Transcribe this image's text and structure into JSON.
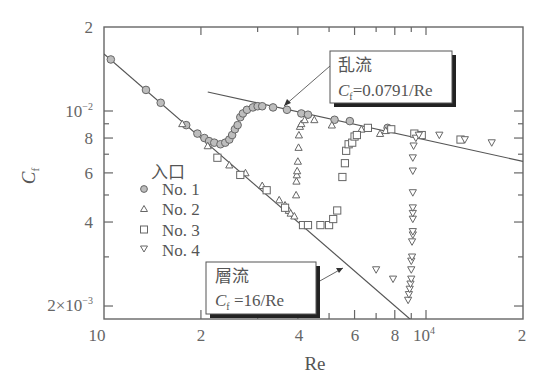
{
  "chart_data": {
    "type": "scatter",
    "title": "",
    "xlabel": "Re",
    "ylabel": "C_f",
    "xscale": "log",
    "yscale": "log",
    "xlim": [
      1000,
      20000
    ],
    "ylim": [
      0.0018,
      0.02
    ],
    "x_tick_labels": [
      {
        "value": 1000,
        "label": "10"
      },
      {
        "value": 2000,
        "label": "2"
      },
      {
        "value": 4000,
        "label": "4"
      },
      {
        "value": 6000,
        "label": "6"
      },
      {
        "value": 8000,
        "label": "8"
      },
      {
        "value": 10000,
        "label": "10",
        "sup": "4"
      },
      {
        "value": 20000,
        "label": "2"
      }
    ],
    "x_minor_ticks": [
      3000,
      5000,
      7000,
      9000
    ],
    "y_tick_labels": [
      {
        "value": 0.02,
        "label": "2"
      },
      {
        "value": 0.01,
        "label": "10",
        "sup": "−2"
      },
      {
        "value": 0.008,
        "label": "8"
      },
      {
        "value": 0.006,
        "label": "6"
      },
      {
        "value": 0.004,
        "label": "4"
      },
      {
        "value": 0.002,
        "label": "2×10",
        "sup": "−3"
      }
    ],
    "y_minor_ticks": [
      0.009,
      0.007,
      0.005,
      0.003
    ],
    "legend": {
      "title": "入口",
      "position": "left-middle",
      "entries": [
        {
          "label": "No. 1",
          "marker": "circle-filled"
        },
        {
          "label": "No. 2",
          "marker": "triangle-up"
        },
        {
          "label": "No. 3",
          "marker": "square"
        },
        {
          "label": "No. 4",
          "marker": "triangle-down"
        }
      ]
    },
    "lines": [
      {
        "name": "層流",
        "equation": "C_f = 16/Re",
        "x": [
          1000,
          9000
        ],
        "y": [
          0.016,
          0.00178
        ]
      },
      {
        "name": "乱流",
        "equation": "C_f = 0.0791/Re^0.25",
        "x": [
          2100,
          20000
        ],
        "y": [
          0.0117,
          0.0066
        ]
      }
    ],
    "annotations": [
      {
        "line1": "乱流",
        "line2_prefix": "C",
        "line2_sub": "f",
        "line2_rest": "=0.0791/Re"
      },
      {
        "line1": "層流",
        "line2_prefix": "C",
        "line2_sub": "f",
        "line2_rest": " =16/Re"
      }
    ],
    "series": [
      {
        "name": "No. 1",
        "marker": "circle-filled",
        "points": [
          [
            1050,
            0.0153
          ],
          [
            1350,
            0.0119
          ],
          [
            1500,
            0.0107
          ],
          [
            1800,
            0.0089
          ],
          [
            1950,
            0.0083
          ],
          [
            2050,
            0.008
          ],
          [
            2120,
            0.0078
          ],
          [
            2200,
            0.0077
          ],
          [
            2300,
            0.0076
          ],
          [
            2380,
            0.0077
          ],
          [
            2450,
            0.0079
          ],
          [
            2500,
            0.0082
          ],
          [
            2550,
            0.0086
          ],
          [
            2600,
            0.0089
          ],
          [
            2650,
            0.0095
          ],
          [
            2700,
            0.0098
          ],
          [
            2780,
            0.0101
          ],
          [
            2900,
            0.0103
          ],
          [
            3000,
            0.0104
          ],
          [
            3100,
            0.0104
          ],
          [
            3350,
            0.0103
          ],
          [
            3700,
            0.0101
          ],
          [
            4100,
            0.0098
          ],
          [
            4300,
            0.0097
          ],
          [
            5200,
            0.0093
          ],
          [
            5800,
            0.0092
          ],
          [
            7600,
            0.0087
          ]
        ]
      },
      {
        "name": "No. 2",
        "marker": "triangle-up",
        "points": [
          [
            1750,
            0.009
          ],
          [
            2100,
            0.0075
          ],
          [
            2450,
            0.0064
          ],
          [
            2750,
            0.006
          ],
          [
            3100,
            0.0054
          ],
          [
            3500,
            0.0048
          ],
          [
            3650,
            0.0046
          ],
          [
            3750,
            0.0044
          ],
          [
            3800,
            0.0043
          ],
          [
            3900,
            0.0042
          ],
          [
            3950,
            0.005
          ],
          [
            3960,
            0.0056
          ],
          [
            3970,
            0.0059
          ],
          [
            3980,
            0.0061
          ],
          [
            4000,
            0.0066
          ],
          [
            4020,
            0.0074
          ],
          [
            4030,
            0.0082
          ],
          [
            4060,
            0.0088
          ],
          [
            4100,
            0.009
          ],
          [
            4200,
            0.0093
          ],
          [
            4500,
            0.0093
          ],
          [
            5100,
            0.0089
          ],
          [
            6300,
            0.0086
          ],
          [
            7200,
            0.0083
          ],
          [
            7500,
            0.0085
          ]
        ]
      },
      {
        "name": "No. 3",
        "marker": "square",
        "points": [
          [
            2250,
            0.0068
          ],
          [
            2650,
            0.0059
          ],
          [
            3200,
            0.0052
          ],
          [
            3650,
            0.0045
          ],
          [
            4150,
            0.0039
          ],
          [
            4300,
            0.0039
          ],
          [
            4700,
            0.0039
          ],
          [
            5000,
            0.0039
          ],
          [
            5150,
            0.0041
          ],
          [
            5300,
            0.0044
          ],
          [
            5500,
            0.0058
          ],
          [
            5600,
            0.0065
          ],
          [
            5650,
            0.0072
          ],
          [
            5750,
            0.0076
          ],
          [
            5900,
            0.0077
          ],
          [
            6000,
            0.0081
          ],
          [
            6100,
            0.0082
          ],
          [
            6600,
            0.0087
          ],
          [
            7800,
            0.0086
          ],
          [
            9200,
            0.0083
          ],
          [
            9700,
            0.0082
          ],
          [
            12800,
            0.0079
          ]
        ]
      },
      {
        "name": "No. 4",
        "marker": "triangle-down",
        "points": [
          [
            7000,
            0.0027
          ],
          [
            7900,
            0.0025
          ],
          [
            8800,
            0.0021
          ],
          [
            8850,
            0.0022
          ],
          [
            8900,
            0.0023
          ],
          [
            8950,
            0.0024
          ],
          [
            9000,
            0.0025
          ],
          [
            9000,
            0.0027
          ],
          [
            9000,
            0.0029
          ],
          [
            9050,
            0.003
          ],
          [
            9050,
            0.0034
          ],
          [
            9100,
            0.0036
          ],
          [
            9100,
            0.0037
          ],
          [
            9100,
            0.0041
          ],
          [
            9100,
            0.0043
          ],
          [
            9100,
            0.0045
          ],
          [
            9100,
            0.0051
          ],
          [
            9100,
            0.0061
          ],
          [
            9100,
            0.0068
          ],
          [
            9150,
            0.0075
          ],
          [
            9300,
            0.008
          ],
          [
            9500,
            0.0082
          ],
          [
            11000,
            0.0082
          ],
          [
            13200,
            0.0079
          ],
          [
            16000,
            0.0077
          ]
        ]
      }
    ]
  },
  "labels": {
    "xlabel": "Re",
    "ylabel_main": "C",
    "ylabel_sub": "f",
    "legend_title": "入口",
    "legend_1": "No. 1",
    "legend_2": "No. 2",
    "legend_3": "No. 3",
    "legend_4": "No. 4",
    "turb_title": "乱流",
    "turb_c": "C",
    "turb_sub": "f",
    "turb_eq": "=0.0791/Re",
    "lam_title": "層流",
    "lam_c": "C",
    "lam_sub": "f",
    "lam_eq": " =16/Re",
    "xt_1000": "10",
    "xt_2000": "2",
    "xt_4000": "4",
    "xt_6000": "6",
    "xt_8000": "8",
    "xt_10000": "10",
    "xt_10000_sup": "4",
    "xt_20000": "2",
    "yt_002": "2",
    "yt_001": "10",
    "yt_001_sup": "−2",
    "yt_0008": "8",
    "yt_0006": "6",
    "yt_0004": "4",
    "yt_0002": "2×10",
    "yt_0002_sup": "−3"
  },
  "colors": {
    "axis": "#666666",
    "line": "#555555",
    "marker_fill_circle": "#bdbdbd",
    "marker_stroke": "#666666",
    "text": "#555555"
  }
}
